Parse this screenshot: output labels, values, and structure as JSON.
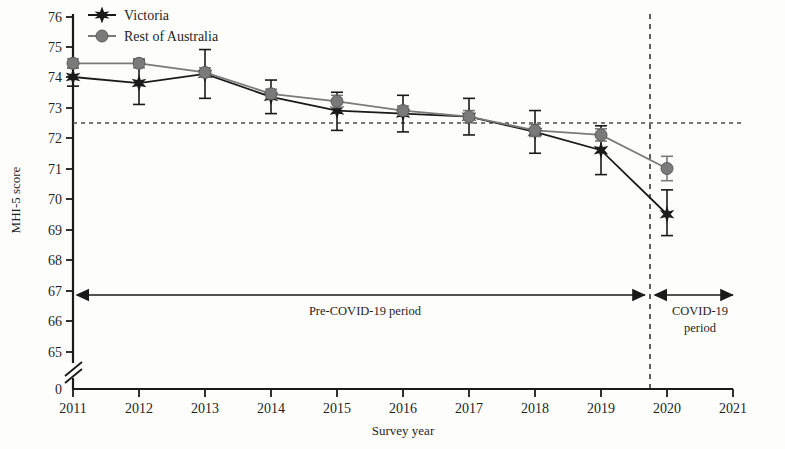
{
  "chart_data": {
    "type": "line",
    "title": "",
    "xlabel": "Survey year",
    "ylabel": "MHI-5 score",
    "x": [
      2011,
      2012,
      2013,
      2014,
      2015,
      2016,
      2017,
      2018,
      2019,
      2020
    ],
    "xlim": [
      2011,
      2021
    ],
    "ylim": [
      65,
      76
    ],
    "x_ticks": [
      "2011",
      "2012",
      "2013",
      "2014",
      "2015",
      "2016",
      "2017",
      "2018",
      "2019",
      "2020",
      "2021"
    ],
    "y_ticks": [
      "0",
      "65",
      "66",
      "67",
      "68",
      "69",
      "70",
      "71",
      "72",
      "73",
      "74",
      "75",
      "76"
    ],
    "y_axis_break": true,
    "grid": false,
    "legend_position": "top-left",
    "series": [
      {
        "name": "Victoria",
        "marker": "star",
        "color": "#1a1a1a",
        "values": [
          74.0,
          73.8,
          74.1,
          73.35,
          72.9,
          72.8,
          72.7,
          72.2,
          71.6,
          69.5
        ],
        "err_low": [
          73.7,
          73.1,
          73.3,
          72.8,
          72.25,
          72.2,
          72.1,
          71.5,
          70.8,
          68.8
        ],
        "err_high": [
          74.3,
          74.55,
          74.9,
          73.9,
          73.5,
          73.4,
          73.3,
          72.9,
          72.4,
          70.3
        ]
      },
      {
        "name": "Rest of Australia",
        "marker": "circle",
        "color": "#7a7a7a",
        "values": [
          74.45,
          74.45,
          74.15,
          73.45,
          73.2,
          72.9,
          72.7,
          72.25,
          72.1,
          71.0
        ],
        "err_low": [
          74.3,
          74.3,
          74.0,
          73.3,
          73.0,
          72.75,
          72.5,
          72.05,
          71.9,
          70.6
        ],
        "err_high": [
          74.6,
          74.6,
          74.3,
          73.6,
          73.4,
          73.05,
          72.9,
          72.45,
          72.3,
          71.4
        ]
      }
    ],
    "reference_line": {
      "type": "horizontal-dashed",
      "value": 72.7
    },
    "period_divider": {
      "type": "vertical-dashed",
      "x": 2019.5
    },
    "annotations": [
      {
        "name": "pre-covid-period",
        "text": "Pre-COVID-19 period",
        "from_x": 2011,
        "to_x": 2019.5,
        "y": 67
      },
      {
        "name": "covid-period-line1",
        "text": "COVID-19",
        "from_x": 2019.5,
        "to_x": 2021,
        "y": 67
      },
      {
        "name": "covid-period-line2",
        "text": "period"
      }
    ]
  },
  "legend": {
    "items": [
      {
        "label": "Victoria"
      },
      {
        "label": "Rest of Australia"
      }
    ]
  },
  "axes": {
    "x_title": "Survey year",
    "y_title": "MHI-5 score"
  }
}
